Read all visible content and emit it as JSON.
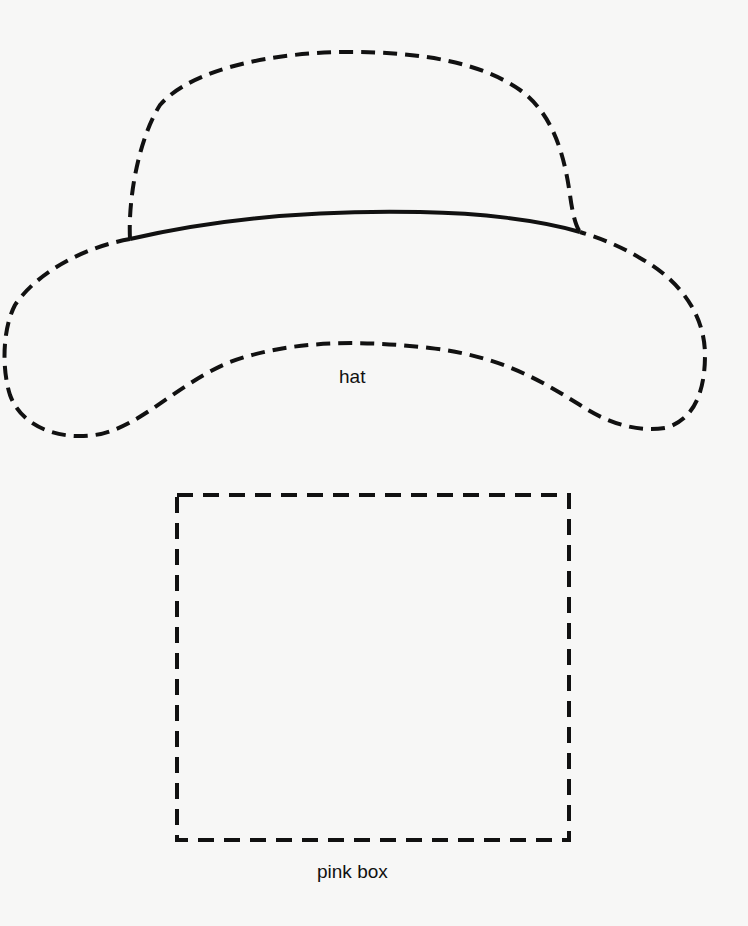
{
  "shapes": [
    {
      "id": "hat",
      "label": "hat",
      "outline_style": "dashed",
      "crown_base_style": "solid"
    },
    {
      "id": "pink-box",
      "label": "pink box",
      "outline_style": "dashed"
    }
  ],
  "colors": {
    "line": "#111111",
    "background": "#f7f7f6",
    "text": "#111111"
  }
}
